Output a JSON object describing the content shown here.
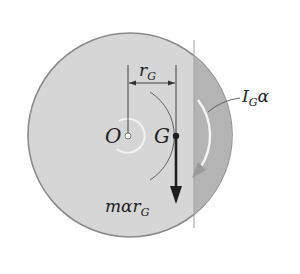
{
  "diagram": {
    "colors": {
      "background": "#ffffff",
      "disk_fill": "#d6d6d6",
      "disk_edge": "#8a8a8a",
      "strip_fill": "#b4b4b4",
      "inner_ring": "#f2f2f2",
      "line": "#333333",
      "arrow": "#1e1e1e",
      "moment_arrow_stroke": "#f4f4f4",
      "moment_arrow_head": "#9a9a9a"
    },
    "points": {
      "O": {
        "label": "O"
      },
      "G": {
        "label": "G"
      }
    },
    "labels": {
      "radius": {
        "main": "r",
        "sub": "G"
      },
      "force": {
        "main": "mαr",
        "sub": "G"
      },
      "moment": {
        "main": "I",
        "sub": "G",
        "tail": "α"
      }
    }
  }
}
